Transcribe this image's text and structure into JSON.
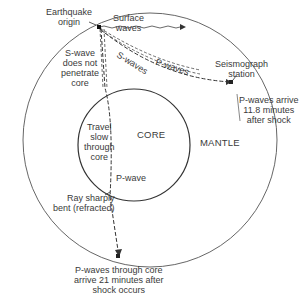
{
  "diagram": {
    "regions": {
      "core": "CORE",
      "mantle": "MANTLE"
    },
    "labels": {
      "origin": [
        "Earthquake",
        "origin"
      ],
      "surface_waves": [
        "Surface",
        "waves"
      ],
      "s_wave_note": [
        "S-wave",
        "does not",
        "penetrate",
        "core"
      ],
      "s_waves": "S-waves",
      "p_waves": "P-waves",
      "station": [
        "Seismograph",
        "station"
      ],
      "p_arrive": [
        "P-waves arrive",
        "11.8 minutes",
        "after shock"
      ],
      "travel_slow": [
        "Travel",
        "slow",
        "through",
        "core"
      ],
      "p_wave": "P-wave",
      "refracted": [
        "Ray sharply",
        "bent (refracted)"
      ],
      "p_core": [
        "P-waves through core",
        "arrive 21 minutes after",
        "shock occurs"
      ]
    },
    "colors": {
      "line": "#3a3a3a",
      "background": "#ffffff"
    }
  }
}
